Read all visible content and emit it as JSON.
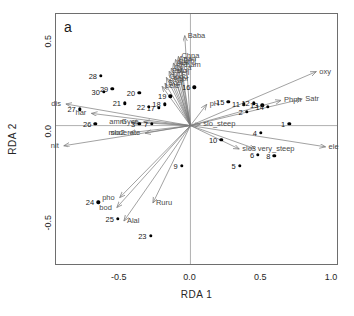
{
  "panel": {
    "tag": "a"
  },
  "chart_data": {
    "type": "scatter",
    "title": "",
    "xlabel": "RDA 1",
    "ylabel": "RDA 2",
    "xlim": [
      -0.95,
      1.05
    ],
    "ylim": [
      -0.78,
      0.62
    ],
    "xticks": [
      "-0.5",
      "0.0",
      "0.5",
      "1.0"
    ],
    "xtickvals": [
      -0.5,
      0.0,
      0.5,
      1.0
    ],
    "yticks": [
      "0.5",
      "0.0",
      "-0.5"
    ],
    "ytickvals": [
      0.5,
      0.0,
      -0.5
    ],
    "grid": false,
    "legend": "none",
    "zero_lines": {
      "x": 0.0,
      "y": 0.0
    },
    "sites": [
      {
        "label": "1",
        "x": 0.705,
        "y": 0.005
      },
      {
        "label": "2",
        "x": 0.405,
        "y": 0.072
      },
      {
        "label": "4",
        "x": 0.505,
        "y": -0.045
      },
      {
        "label": "5",
        "x": 0.355,
        "y": -0.228
      },
      {
        "label": "6",
        "x": 0.485,
        "y": -0.168
      },
      {
        "label": "9",
        "x": -0.055,
        "y": -0.228
      },
      {
        "label": "10",
        "x": 0.225,
        "y": -0.085
      },
      {
        "label": "11",
        "x": 0.385,
        "y": 0.112
      },
      {
        "label": "12",
        "x": 0.455,
        "y": 0.118
      },
      {
        "label": "13",
        "x": 0.515,
        "y": 0.108
      },
      {
        "label": "14",
        "x": 0.555,
        "y": 0.1
      },
      {
        "label": "15",
        "x": 0.275,
        "y": 0.128
      },
      {
        "label": "16",
        "x": 0.035,
        "y": 0.208
      },
      {
        "label": "17",
        "x": -0.215,
        "y": 0.092
      },
      {
        "label": "18",
        "x": -0.175,
        "y": 0.112
      },
      {
        "label": "19",
        "x": -0.135,
        "y": 0.158
      },
      {
        "label": "20",
        "x": -0.355,
        "y": 0.175
      },
      {
        "label": "21",
        "x": -0.455,
        "y": 0.118
      },
      {
        "label": "22",
        "x": -0.285,
        "y": 0.098
      },
      {
        "label": "23",
        "x": -0.275,
        "y": -0.618
      },
      {
        "label": "24",
        "x": -0.645,
        "y": -0.432
      },
      {
        "label": "25",
        "x": -0.505,
        "y": -0.525
      },
      {
        "label": "26",
        "x": -0.665,
        "y": 0.005
      },
      {
        "label": "27",
        "x": -0.775,
        "y": 0.085
      },
      {
        "label": "28",
        "x": -0.625,
        "y": 0.272
      },
      {
        "label": "29",
        "x": -0.545,
        "y": 0.198
      },
      {
        "label": "30",
        "x": -0.605,
        "y": 0.182
      },
      {
        "label": "3",
        "x": -0.355,
        "y": 0.005
      },
      {
        "label": "7",
        "x": -0.265,
        "y": 0.005
      },
      {
        "label": "8",
        "x": 0.6,
        "y": -0.175
      }
    ],
    "arrows": [
      {
        "label": "oxy",
        "x": 0.89,
        "y": 0.3,
        "side": "right",
        "kind": "env"
      },
      {
        "label": "ele",
        "x": 0.955,
        "y": -0.118,
        "side": "right",
        "kind": "env"
      },
      {
        "label": "Satr",
        "x": 0.79,
        "y": 0.148,
        "side": "right",
        "kind": "species"
      },
      {
        "label": "Phph",
        "x": 0.64,
        "y": 0.14,
        "side": "right",
        "kind": "species"
      },
      {
        "label": "pH",
        "x": 0.115,
        "y": 0.118,
        "side": "right",
        "kind": "env"
      },
      {
        "label": "slo_steep",
        "x": 0.07,
        "y": 0.008,
        "side": "right",
        "kind": "env"
      },
      {
        "label": "very_steep",
        "x": 0.455,
        "y": -0.128,
        "side": "right",
        "kind": "env"
      },
      {
        "label": "slo3",
        "x": 0.345,
        "y": -0.13,
        "side": "right",
        "kind": "env"
      },
      {
        "label": "dis",
        "x": -0.88,
        "y": 0.12,
        "side": "left",
        "kind": "env"
      },
      {
        "label": "nit",
        "x": -0.895,
        "y": -0.112,
        "side": "left",
        "kind": "env"
      },
      {
        "label": "har",
        "x": -0.7,
        "y": 0.068,
        "side": "left",
        "kind": "env"
      },
      {
        "label": "amm",
        "x": -0.42,
        "y": 0.02,
        "side": "left",
        "kind": "env"
      },
      {
        "label": "Gyce",
        "x": -0.33,
        "y": 0.022,
        "side": "left",
        "kind": "species"
      },
      {
        "label": "slo2",
        "x": -0.43,
        "y": -0.04,
        "side": "left",
        "kind": "env"
      },
      {
        "label": "moderate",
        "x": -0.32,
        "y": -0.042,
        "side": "left",
        "kind": "env"
      },
      {
        "label": "Baba",
        "x": -0.04,
        "y": 0.5,
        "side": "right",
        "kind": "species"
      },
      {
        "label": "Chna",
        "x": -0.085,
        "y": 0.385,
        "side": "right",
        "kind": "species"
      },
      {
        "label": "Anan",
        "x": -0.105,
        "y": 0.368,
        "side": "right",
        "kind": "species"
      },
      {
        "label": "Blbj",
        "x": -0.07,
        "y": 0.36,
        "side": "right",
        "kind": "species"
      },
      {
        "label": "Alal",
        "x": -0.12,
        "y": 0.348,
        "side": "right",
        "kind": "species"
      },
      {
        "label": "Rham",
        "x": -0.09,
        "y": 0.338,
        "side": "right",
        "kind": "species"
      },
      {
        "label": "Cyca",
        "x": -0.135,
        "y": 0.32,
        "side": "right",
        "kind": "species"
      },
      {
        "label": "Eslu",
        "x": -0.15,
        "y": 0.302,
        "side": "right",
        "kind": "species"
      },
      {
        "label": "Pefl",
        "x": -0.12,
        "y": 0.295,
        "side": "right",
        "kind": "species"
      },
      {
        "label": "Gogo",
        "x": -0.17,
        "y": 0.268,
        "side": "right",
        "kind": "species"
      },
      {
        "label": "Abbr",
        "x": -0.145,
        "y": 0.258,
        "side": "right",
        "kind": "species"
      },
      {
        "label": "Scer",
        "x": -0.18,
        "y": 0.235,
        "side": "right",
        "kind": "species"
      },
      {
        "label": "Lele",
        "x": -0.2,
        "y": 0.218,
        "side": "right",
        "kind": "species"
      },
      {
        "label": "Ruru",
        "x": -0.265,
        "y": -0.43,
        "side": "right",
        "kind": "species"
      },
      {
        "label": "Alal2",
        "x": -0.47,
        "y": -0.53,
        "side": "right",
        "kind": "species"
      },
      {
        "label": "bod",
        "x": -0.52,
        "y": -0.455,
        "side": "left",
        "kind": "env"
      },
      {
        "label": "pho",
        "x": -0.5,
        "y": -0.4,
        "side": "left",
        "kind": "env"
      }
    ]
  }
}
